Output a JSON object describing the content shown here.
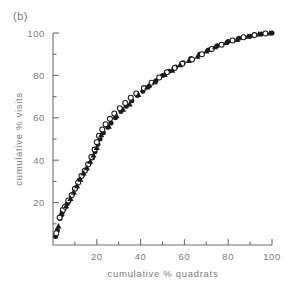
{
  "figure": {
    "panel_label": "(b)",
    "background_color": "#ffffff",
    "ink_color": "#1b1b1b",
    "axis_color": "#6d6d6d"
  },
  "chart_data": {
    "type": "scatter",
    "title": "(b)",
    "xlabel": "cumulative % quadrats",
    "ylabel": "cumulative % visits",
    "xlim": [
      0,
      100
    ],
    "ylim": [
      0,
      100
    ],
    "xticks": [
      20,
      40,
      60,
      80,
      100
    ],
    "yticks": [
      20,
      40,
      60,
      80,
      100
    ],
    "xticklabels": [
      "20",
      "40",
      "60",
      "80",
      "100"
    ],
    "yticklabels": [
      "20",
      "40",
      "60",
      "80",
      "100"
    ],
    "xminorticks": [
      10,
      30,
      50,
      70,
      90
    ],
    "yminorticks": [
      10,
      30,
      50,
      70,
      90
    ],
    "grid": false,
    "legend": null,
    "series": [
      {
        "name": "filled-circle",
        "marker": "circle-filled",
        "points": [
          [
            1.2,
            4.0
          ],
          [
            2.0,
            7.0
          ],
          [
            3.2,
            12.5
          ],
          [
            3.8,
            14.0
          ],
          [
            4.2,
            15.5
          ],
          [
            5.0,
            17.0
          ],
          [
            6.5,
            19.5
          ],
          [
            7.2,
            20.5
          ],
          [
            9.0,
            24.0
          ],
          [
            10.5,
            27.0
          ],
          [
            12.0,
            30.5
          ],
          [
            13.5,
            33.0
          ],
          [
            15.0,
            35.5
          ],
          [
            16.5,
            38.5
          ],
          [
            18.0,
            41.0
          ],
          [
            19.2,
            44.0
          ],
          [
            20.5,
            47.5
          ],
          [
            21.5,
            50.0
          ],
          [
            23.0,
            53.0
          ],
          [
            25.0,
            55.5
          ],
          [
            26.5,
            57.5
          ],
          [
            28.5,
            60.0
          ],
          [
            31.0,
            63.0
          ],
          [
            33.5,
            65.5
          ],
          [
            36.0,
            68.0
          ],
          [
            38.5,
            70.5
          ],
          [
            41.0,
            72.5
          ],
          [
            44.0,
            75.0
          ],
          [
            47.0,
            77.5
          ],
          [
            50.0,
            80.0
          ],
          [
            53.0,
            82.0
          ],
          [
            56.0,
            84.0
          ],
          [
            59.5,
            86.0
          ],
          [
            63.0,
            88.0
          ],
          [
            67.0,
            90.0
          ],
          [
            71.0,
            92.0
          ],
          [
            75.0,
            94.0
          ],
          [
            80.0,
            96.0
          ],
          [
            85.0,
            97.5
          ],
          [
            90.0,
            98.5
          ],
          [
            95.0,
            99.5
          ],
          [
            100.0,
            100.0
          ]
        ]
      },
      {
        "name": "open-circle",
        "marker": "circle-open",
        "points": [
          [
            1.5,
            5.5
          ],
          [
            3.0,
            13.0
          ],
          [
            4.5,
            16.5
          ],
          [
            5.5,
            18.0
          ],
          [
            7.0,
            21.0
          ],
          [
            8.5,
            23.5
          ],
          [
            10.0,
            26.5
          ],
          [
            11.5,
            29.5
          ],
          [
            13.0,
            32.5
          ],
          [
            14.5,
            35.0
          ],
          [
            16.0,
            38.0
          ],
          [
            17.5,
            41.5
          ],
          [
            19.0,
            45.0
          ],
          [
            20.0,
            48.5
          ],
          [
            21.0,
            51.5
          ],
          [
            22.5,
            54.5
          ],
          [
            24.0,
            57.0
          ],
          [
            26.0,
            59.5
          ],
          [
            28.0,
            62.0
          ],
          [
            30.5,
            64.5
          ],
          [
            33.0,
            67.0
          ],
          [
            35.5,
            69.5
          ],
          [
            38.0,
            71.5
          ],
          [
            41.5,
            74.0
          ],
          [
            45.0,
            76.5
          ],
          [
            48.5,
            79.0
          ],
          [
            52.0,
            81.5
          ],
          [
            55.5,
            83.5
          ],
          [
            59.0,
            85.5
          ],
          [
            63.5,
            87.5
          ],
          [
            68.0,
            90.0
          ],
          [
            72.5,
            92.5
          ],
          [
            77.0,
            94.5
          ],
          [
            82.0,
            96.5
          ],
          [
            87.0,
            98.0
          ],
          [
            92.0,
            99.0
          ],
          [
            97.0,
            99.8
          ]
        ]
      },
      {
        "name": "triangle",
        "marker": "triangle-filled",
        "points": [
          [
            2.5,
            9.0
          ],
          [
            4.0,
            15.0
          ],
          [
            6.0,
            18.5
          ],
          [
            8.0,
            22.0
          ],
          [
            9.5,
            25.0
          ],
          [
            11.0,
            28.0
          ],
          [
            12.5,
            31.0
          ],
          [
            14.0,
            34.0
          ],
          [
            15.5,
            36.5
          ],
          [
            17.0,
            39.5
          ],
          [
            18.5,
            42.5
          ],
          [
            20.0,
            46.0
          ],
          [
            22.0,
            52.0
          ],
          [
            25.5,
            56.0
          ],
          [
            29.0,
            61.0
          ],
          [
            32.0,
            64.0
          ],
          [
            35.0,
            66.5
          ],
          [
            39.0,
            71.0
          ],
          [
            43.0,
            74.5
          ],
          [
            46.5,
            77.0
          ],
          [
            51.0,
            80.5
          ],
          [
            54.5,
            82.5
          ],
          [
            58.0,
            85.0
          ],
          [
            62.0,
            87.0
          ],
          [
            66.0,
            89.0
          ],
          [
            70.0,
            91.5
          ],
          [
            74.0,
            93.5
          ],
          [
            79.0,
            95.5
          ],
          [
            84.0,
            97.0
          ],
          [
            89.0,
            98.5
          ],
          [
            94.0,
            99.5
          ],
          [
            99.0,
            100.0
          ]
        ]
      }
    ]
  }
}
